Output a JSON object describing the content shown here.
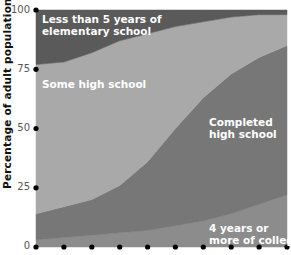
{
  "chart_data": {
    "type": "area",
    "stacked": true,
    "title": "",
    "xlabel": "",
    "ylabel": "Percentage of adult population",
    "ylim": [
      0,
      100
    ],
    "yticks": [
      0,
      25,
      50,
      75,
      100
    ],
    "x_points": 10,
    "x_tick_labels": [],
    "grid": false,
    "series": [
      {
        "name": "4 years or more of college",
        "values": [
          3,
          4,
          5,
          6,
          7,
          9,
          11,
          14,
          18,
          22
        ],
        "color": "#8c8c8c"
      },
      {
        "name": "Completed high school",
        "values": [
          11,
          13,
          15,
          20,
          29,
          41,
          52,
          59,
          62,
          63
        ],
        "color": "#777777"
      },
      {
        "name": "Some high school",
        "values": [
          63,
          61,
          62,
          61,
          54,
          43,
          32,
          24,
          18,
          13
        ],
        "color": "#a9a9a9"
      },
      {
        "name": "Less than 5 years of elementary school",
        "values": [
          23,
          22,
          18,
          13,
          10,
          7,
          5,
          3,
          2,
          2
        ],
        "color": "#5a5a5a"
      }
    ]
  },
  "axis": {
    "ylabel": "Percentage of adult population",
    "ticks": [
      "100",
      "75",
      "50",
      "25",
      "0"
    ]
  },
  "labels": {
    "elementary_line1": "Less than 5 years of",
    "elementary_line2": "elementary school",
    "some_hs": "Some high school",
    "completed_line1": "Completed",
    "completed_line2": "high school",
    "college_line1": "4 years or",
    "college_line2": "more of college"
  }
}
